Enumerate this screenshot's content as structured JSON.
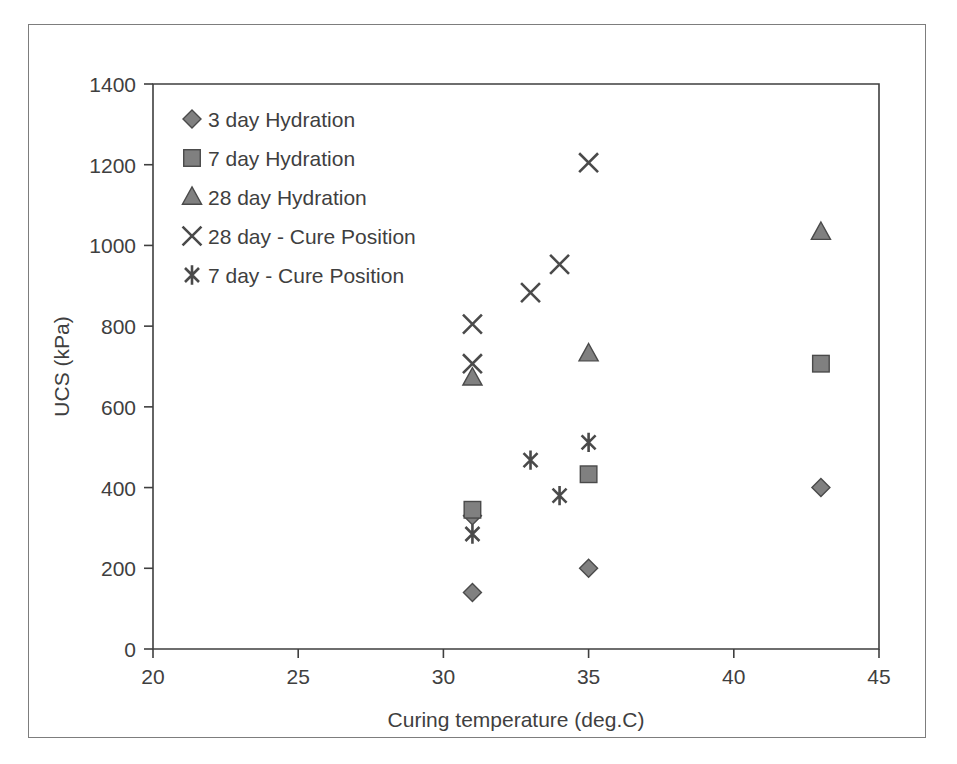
{
  "figure": {
    "background_color": "#ffffff",
    "frame_color": "#7d7d7d",
    "axis_color": "#3f3f3f",
    "marker_fill_color": "#808080",
    "marker_edge_color": "#4a4a4a"
  },
  "chart_data": {
    "type": "scatter",
    "title": "",
    "xlabel": "Curing temperature  (deg.C)",
    "ylabel": "UCS (kPa)",
    "xlim": [
      20,
      45
    ],
    "ylim": [
      0,
      1400
    ],
    "xticks": [
      20,
      25,
      30,
      35,
      40,
      45
    ],
    "yticks": [
      0,
      200,
      400,
      600,
      800,
      1000,
      1200,
      1400
    ],
    "xtick_labels": [
      "20",
      "25",
      "30",
      "35",
      "40",
      "45"
    ],
    "ytick_labels": [
      "0",
      "200",
      "400",
      "600",
      "800",
      "1000",
      "1200",
      "1400"
    ],
    "grid": false,
    "legend_position": "top-left",
    "series": [
      {
        "name": "3 day Hydration",
        "marker": "diamond",
        "points": [
          {
            "x": 31,
            "y": 140
          },
          {
            "x": 31,
            "y": 330
          },
          {
            "x": 35,
            "y": 200
          },
          {
            "x": 43,
            "y": 400
          }
        ]
      },
      {
        "name": "7 day Hydration",
        "marker": "square",
        "points": [
          {
            "x": 31,
            "y": 345
          },
          {
            "x": 35,
            "y": 433
          },
          {
            "x": 43,
            "y": 707
          }
        ]
      },
      {
        "name": "28 day Hydration",
        "marker": "triangle",
        "points": [
          {
            "x": 31,
            "y": 672
          },
          {
            "x": 35,
            "y": 732
          },
          {
            "x": 43,
            "y": 1033
          }
        ]
      },
      {
        "name": "28 day - Cure Position",
        "marker": "x-cross",
        "points": [
          {
            "x": 31,
            "y": 805
          },
          {
            "x": 31,
            "y": 707
          },
          {
            "x": 33,
            "y": 883
          },
          {
            "x": 34,
            "y": 953
          },
          {
            "x": 35,
            "y": 1205
          }
        ]
      },
      {
        "name": "7 day - Cure Position",
        "marker": "six-star",
        "points": [
          {
            "x": 31,
            "y": 285
          },
          {
            "x": 33,
            "y": 468
          },
          {
            "x": 34,
            "y": 380
          },
          {
            "x": 35,
            "y": 512
          }
        ]
      }
    ]
  },
  "legend": {
    "items": [
      {
        "label": "3 day Hydration",
        "marker": "diamond"
      },
      {
        "label": "7 day Hydration",
        "marker": "square"
      },
      {
        "label": "28 day Hydration",
        "marker": "triangle"
      },
      {
        "label": "28 day - Cure Position",
        "marker": "x-cross"
      },
      {
        "label": "7 day - Cure Position",
        "marker": "six-star"
      }
    ]
  }
}
